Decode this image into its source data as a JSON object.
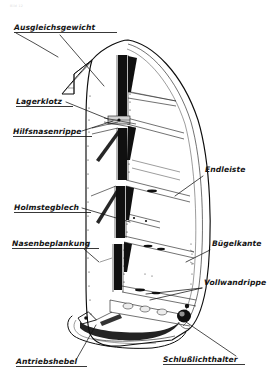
{
  "figure": {
    "corner_artifact": "Bild 12",
    "background_color": "#ffffff",
    "ink_color": "#111111"
  },
  "callouts": [
    {
      "id": "ausgleichsgewicht",
      "label": "Ausgleichsgewicht",
      "side": "left",
      "text_x": 14,
      "text_y": 30,
      "underline": true,
      "leader": "M 16 33 L 34 43 L 58 57",
      "second_leader": "M 60 35 L 104 86"
    },
    {
      "id": "lagerklotz",
      "label": "Lagerklotz",
      "side": "left",
      "text_x": 16,
      "text_y": 104,
      "underline": true,
      "leader": "M 66 102 L 108 119",
      "second_leader": ""
    },
    {
      "id": "hilfsnasenrippe",
      "label": "Hilfsnasenrippe",
      "side": "left",
      "text_x": 13,
      "text_y": 134,
      "underline": true,
      "leader": "M 82 131 L 113 121",
      "second_leader": ""
    },
    {
      "id": "holmstegblech",
      "label": "Holmstegblech",
      "side": "left",
      "text_x": 14,
      "text_y": 210,
      "underline": true,
      "leader": "M 82 208 L 130 222",
      "second_leader": ""
    },
    {
      "id": "nasenbeplankung",
      "label": "Nasenbeplankung",
      "side": "left",
      "text_x": 12,
      "text_y": 246,
      "underline": true,
      "leader": "M 84 249 L 99 262",
      "second_leader": ""
    },
    {
      "id": "antriebshebel",
      "label": "Antriebshebel",
      "side": "left",
      "text_x": 16,
      "text_y": 364,
      "underline": true,
      "leader": "M 76 360 L 96 325",
      "second_leader": ""
    },
    {
      "id": "endleiste",
      "label": "Endleiste",
      "side": "right",
      "text_x": 205,
      "text_y": 172,
      "underline": false,
      "leader": "M 203 176 L 175 196",
      "second_leader": ""
    },
    {
      "id": "buegelkante",
      "label": "Bügelkante",
      "side": "right",
      "text_x": 212,
      "text_y": 246,
      "underline": false,
      "leader": "M 210 250 L 186 262",
      "second_leader": ""
    },
    {
      "id": "vollwandrippe",
      "label": "Vollwandrippe",
      "side": "right",
      "text_x": 204,
      "text_y": 285,
      "underline": false,
      "leader": "M 202 288 L 150 300",
      "second_leader": "M 202 288 L 146 294"
    },
    {
      "id": "schlusslichthalter",
      "label": "Schlußlichthalter",
      "side": "right",
      "text_x": 163,
      "text_y": 362,
      "underline": true,
      "leader": "M 236 356 L 186 322",
      "second_leader": ""
    }
  ],
  "structure": {
    "part_name": "Seitenruder",
    "rib_count": 6,
    "spar_label": "Holm",
    "notes": "Cutaway view showing internal ribs, nose spar and trailing edge"
  }
}
